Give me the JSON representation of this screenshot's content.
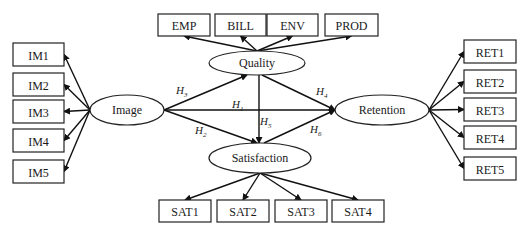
{
  "diagram": {
    "type": "structural-equation-model",
    "latent_constructs": [
      {
        "id": "image",
        "label": "Image",
        "cx": 127,
        "cy": 110,
        "rx": 37,
        "ry": 15
      },
      {
        "id": "quality",
        "label": "Quality",
        "cx": 257,
        "cy": 63,
        "rx": 48,
        "ry": 12
      },
      {
        "id": "satisfaction",
        "label": "Satisfaction",
        "cx": 260,
        "cy": 158,
        "rx": 51,
        "ry": 15
      },
      {
        "id": "retention",
        "label": "Retention",
        "cx": 382,
        "cy": 110,
        "rx": 47,
        "ry": 15
      }
    ],
    "indicators": {
      "image": [
        {
          "label": "IM1",
          "x": 13,
          "y": 43,
          "w": 51,
          "h": 23
        },
        {
          "label": "IM2",
          "x": 13,
          "y": 73,
          "w": 51,
          "h": 23
        },
        {
          "label": "IM3",
          "x": 13,
          "y": 100,
          "w": 51,
          "h": 23
        },
        {
          "label": "IM4",
          "x": 13,
          "y": 129,
          "w": 51,
          "h": 23
        },
        {
          "label": "IM5",
          "x": 13,
          "y": 160,
          "w": 51,
          "h": 23
        }
      ],
      "quality": [
        {
          "label": "EMP",
          "x": 158,
          "y": 14,
          "w": 52,
          "h": 22
        },
        {
          "label": "BILL",
          "x": 215,
          "y": 14,
          "w": 51,
          "h": 22
        },
        {
          "label": "ENV",
          "x": 267,
          "y": 14,
          "w": 51,
          "h": 22
        },
        {
          "label": "PROD",
          "x": 325,
          "y": 14,
          "w": 53,
          "h": 22
        }
      ],
      "satisfaction": [
        {
          "label": "SAT1",
          "x": 159,
          "y": 200,
          "w": 52,
          "h": 22
        },
        {
          "label": "SAT2",
          "x": 217,
          "y": 200,
          "w": 52,
          "h": 22
        },
        {
          "label": "SAT3",
          "x": 275,
          "y": 200,
          "w": 52,
          "h": 22
        },
        {
          "label": "SAT4",
          "x": 332,
          "y": 200,
          "w": 52,
          "h": 22
        }
      ],
      "retention": [
        {
          "label": "RET1",
          "x": 464,
          "y": 40,
          "w": 52,
          "h": 23
        },
        {
          "label": "RET2",
          "x": 464,
          "y": 70,
          "w": 52,
          "h": 23
        },
        {
          "label": "RET3",
          "x": 464,
          "y": 98,
          "w": 52,
          "h": 23
        },
        {
          "label": "RET4",
          "x": 464,
          "y": 126,
          "w": 52,
          "h": 23
        },
        {
          "label": "RET5",
          "x": 464,
          "y": 157,
          "w": 52,
          "h": 23
        }
      ]
    },
    "hypotheses": [
      {
        "id": "H3",
        "main": "H",
        "sub": "3",
        "from": "image",
        "to": "quality",
        "lx": 176,
        "ly": 94
      },
      {
        "id": "H1",
        "main": "H",
        "sub": "1",
        "from": "image",
        "to": "retention",
        "lx": 232,
        "ly": 108
      },
      {
        "id": "H2",
        "main": "H",
        "sub": "2",
        "from": "image",
        "to": "satisfaction",
        "lx": 195,
        "ly": 134
      },
      {
        "id": "H4",
        "main": "H",
        "sub": "4",
        "from": "quality",
        "to": "retention",
        "lx": 316,
        "ly": 95
      },
      {
        "id": "H5",
        "main": "H",
        "sub": "5",
        "from": "quality",
        "to": "satisfaction",
        "lx": 260,
        "ly": 125
      },
      {
        "id": "H6",
        "main": "H",
        "sub": "6",
        "from": "satisfaction",
        "to": "retention",
        "lx": 310,
        "ly": 133
      }
    ]
  }
}
